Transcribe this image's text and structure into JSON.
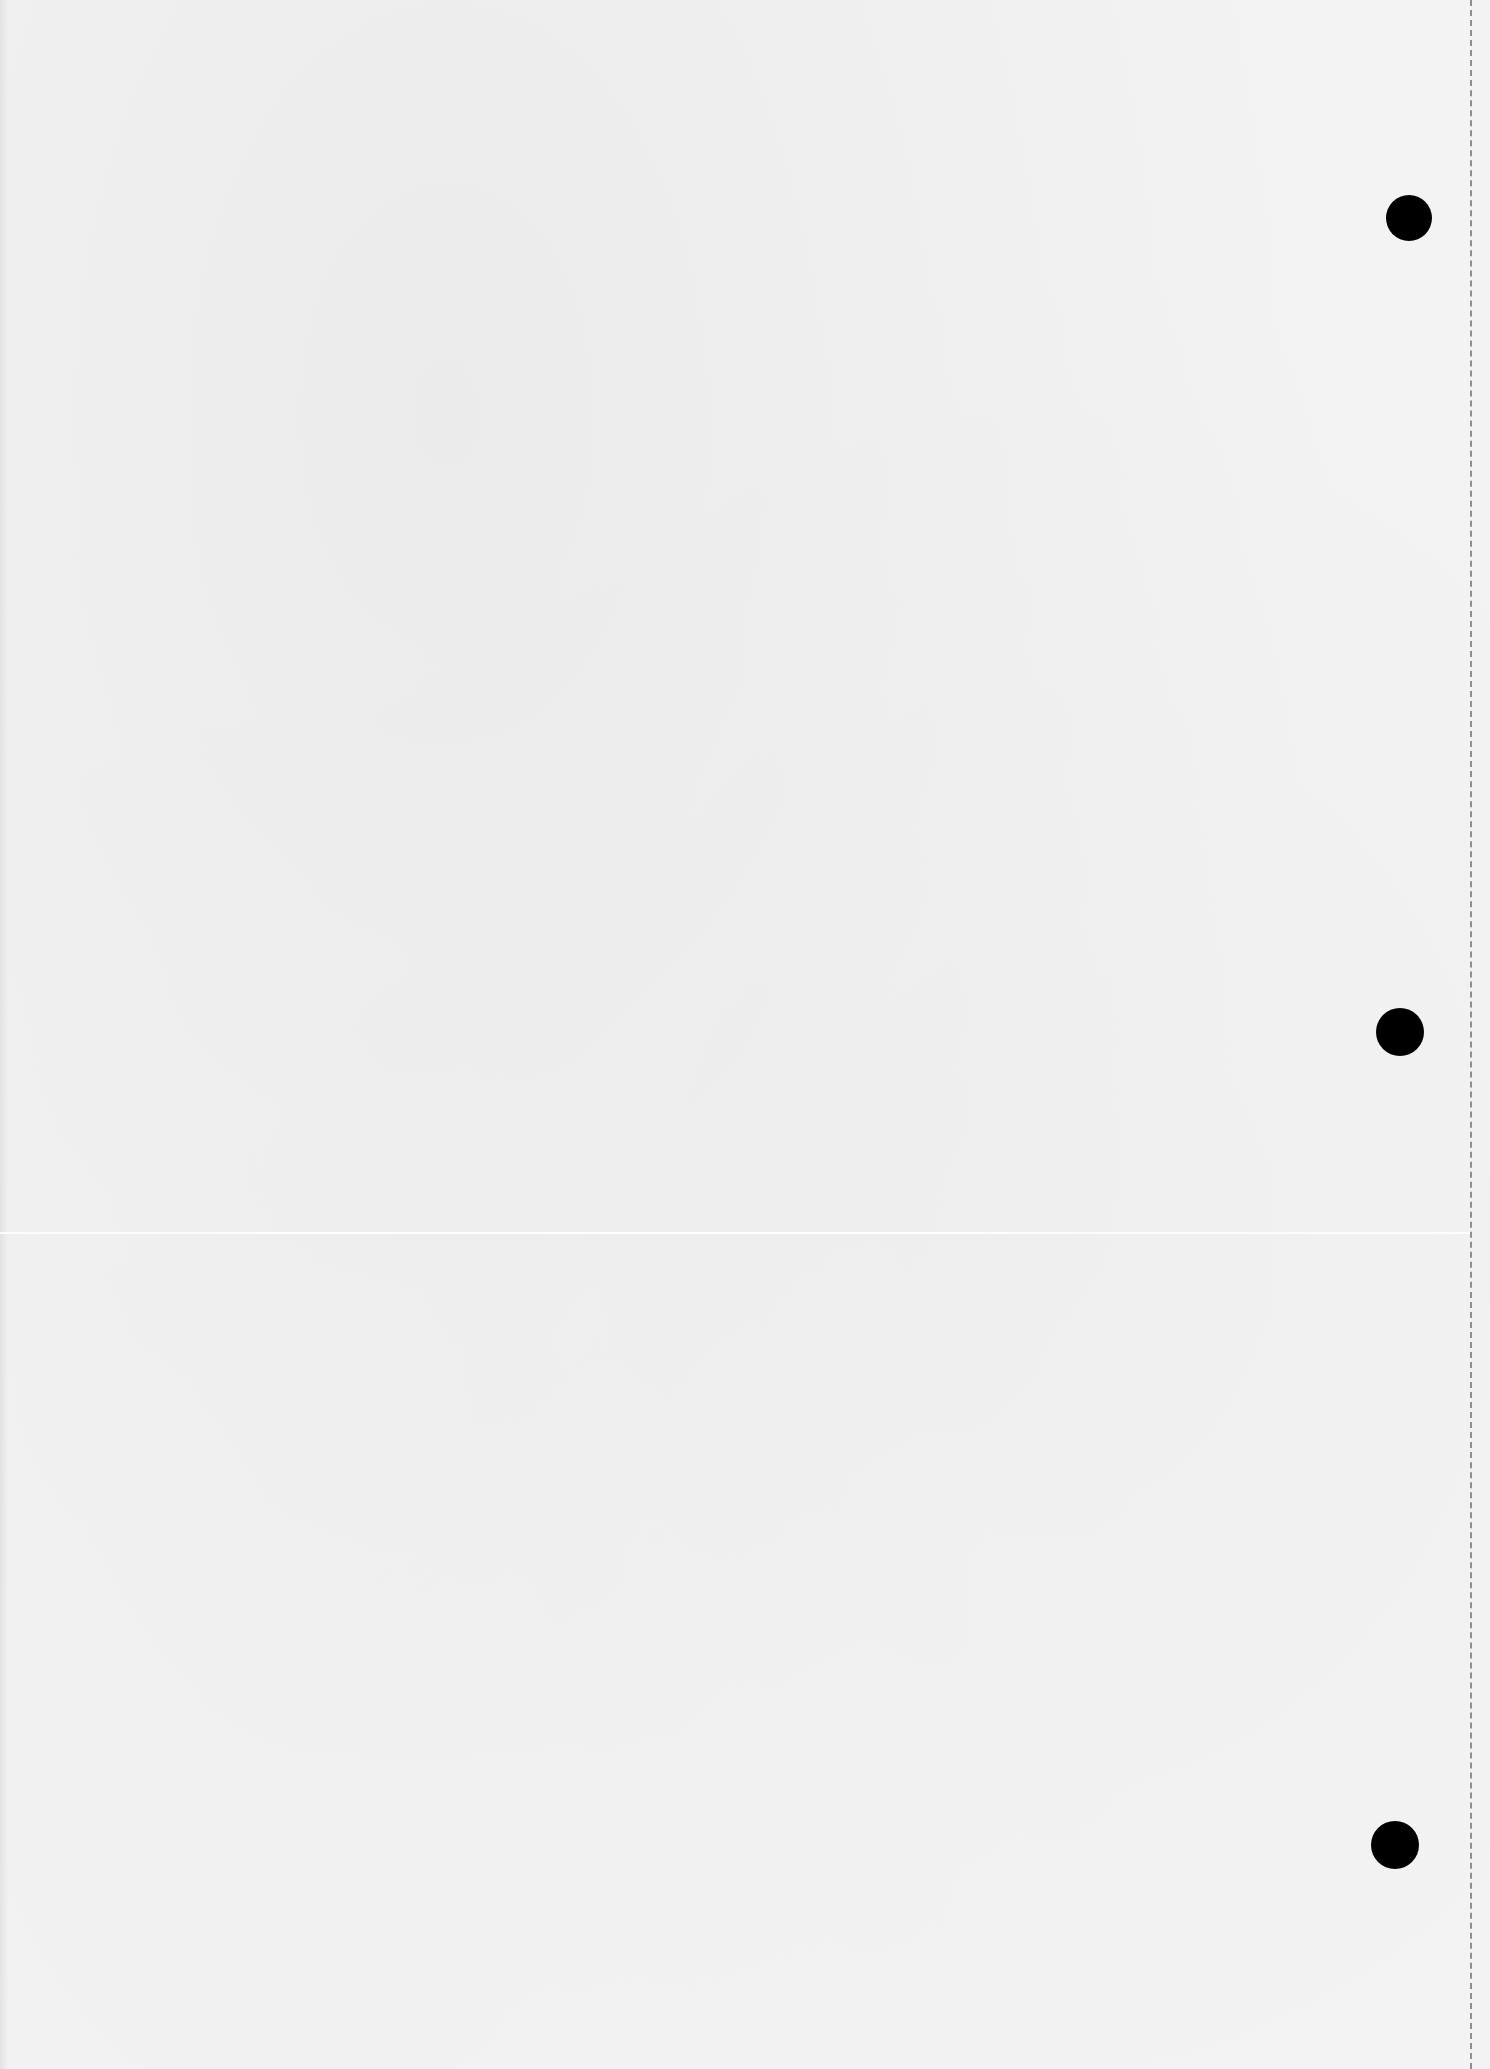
{
  "page": {
    "type": "blank reverse side of scanned page",
    "background_color": "#f3f3f3",
    "bleed_through_text": {
      "legible": false,
      "title_line": "",
      "header_lines": [
        "",
        "",
        ""
      ],
      "body_lines": [
        "",
        "",
        "",
        "",
        "",
        "",
        "",
        "",
        "",
        "",
        "",
        "",
        "",
        "",
        "",
        "",
        "",
        "",
        "",
        "",
        "",
        "",
        "",
        "",
        ""
      ]
    },
    "punch_holes": [
      {
        "cx": 1409,
        "cy": 218,
        "r": 23,
        "color": "#000000"
      },
      {
        "cx": 1400,
        "cy": 1032,
        "r": 24,
        "color": "#000000"
      },
      {
        "cx": 1395,
        "cy": 1845,
        "r": 24,
        "color": "#000000"
      }
    ],
    "tear_line": {
      "x": 1470,
      "style": "dashed",
      "color": "#6e6e6e"
    }
  }
}
